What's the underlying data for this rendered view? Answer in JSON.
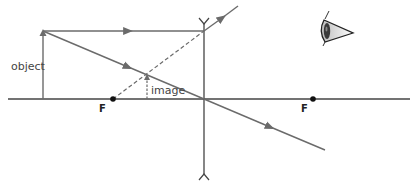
{
  "diagram": {
    "type": "ray-diagram",
    "labels": {
      "object": "object",
      "image": "image",
      "focal_left": "F",
      "focal_right": "F"
    },
    "colors": {
      "axis": "#444444",
      "ray": "#6b6b6b",
      "lens": "#444444",
      "focal_point": "#111111",
      "text": "#444444"
    },
    "icons": {
      "observer": "eye-icon"
    }
  }
}
